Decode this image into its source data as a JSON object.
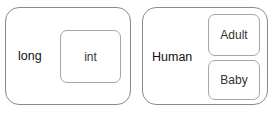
{
  "diagrams": [
    {
      "outer_label": "long",
      "inner": [
        {
          "label": "int"
        }
      ]
    },
    {
      "outer_label": "Human",
      "inner": [
        {
          "label": "Adult"
        },
        {
          "label": "Baby"
        }
      ]
    }
  ]
}
